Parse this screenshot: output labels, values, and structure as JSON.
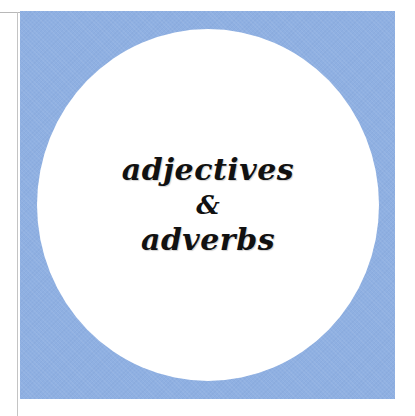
{
  "cover": {
    "title_line_1": "adjectives",
    "title_connector": "&",
    "title_line_2": "adverbs"
  },
  "colors": {
    "background": "#ffffff",
    "square": "#8fb0e2",
    "circle": "#ffffff",
    "text": "#111111"
  }
}
